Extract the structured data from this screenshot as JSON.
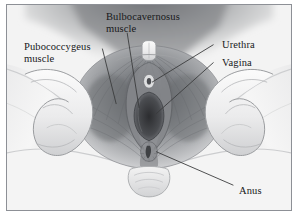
{
  "figure": {
    "style": "grayscale-medical-illustration",
    "frame_color": "#8d9096",
    "background_color": "#f2f2f2",
    "ink_color": "#17181a"
  },
  "labels": {
    "bulbocavernosus": "Bulbocavernosus\nmuscle",
    "pubococcygeus": "Pubococcygeus\nmuscle",
    "urethra": "Urethra",
    "vagina": "Vagina",
    "anus": "Anus"
  }
}
